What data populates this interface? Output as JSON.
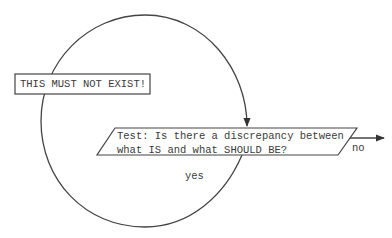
{
  "diagram": {
    "type": "flowchart-loop",
    "colors": {
      "line": "#444444",
      "text": "#3a3a3a",
      "background": "#ffffff"
    },
    "state_box": {
      "label": "THIS MUST NOT EXIST!"
    },
    "decision": {
      "line1": "Test: Is there a discrepancy between",
      "line2": "what IS and what SHOULD BE?"
    },
    "edges": {
      "no_label": "no",
      "yes_label": "yes"
    }
  }
}
